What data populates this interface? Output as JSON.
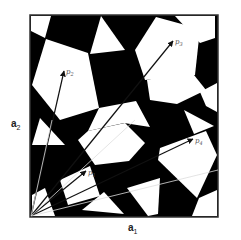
{
  "figure": {
    "axes": {
      "a1": {
        "base": "a",
        "sub": "1"
      },
      "a2": {
        "base": "a",
        "sub": "2"
      }
    },
    "vectors": [
      {
        "label": "p",
        "sub": "2",
        "tip": [
          64,
          71
        ]
      },
      {
        "label": "p",
        "sub": "3",
        "tip": [
          173,
          41
        ]
      },
      {
        "label": "p",
        "sub": "1",
        "tip": [
          86,
          171
        ]
      },
      {
        "label": "p",
        "sub": "4",
        "tip": [
          193,
          139
        ]
      }
    ],
    "colors": {
      "tile_dark": "#000000",
      "tile_light": "#ffffff",
      "border": "#333333",
      "arrow_dark": "#111111",
      "arrow_light": "#dddddd"
    },
    "square": {
      "x": 30,
      "y": 15,
      "w": 188,
      "h": 202
    },
    "origin": [
      31,
      216
    ]
  }
}
